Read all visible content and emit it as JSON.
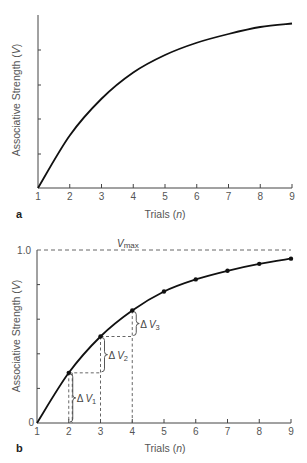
{
  "chart_data": [
    {
      "panel": "a",
      "type": "line",
      "title": "",
      "xlabel": "Trials (n)",
      "ylabel": "Associative Strength (V)",
      "x": [
        1,
        2,
        3,
        4,
        5,
        6,
        7,
        8,
        9
      ],
      "series": [
        {
          "name": "V",
          "values": [
            0.0,
            0.3,
            0.51,
            0.66,
            0.76,
            0.83,
            0.88,
            0.92,
            0.94
          ]
        }
      ],
      "xticks": [
        "1",
        "2",
        "3",
        "4",
        "5",
        "6",
        "7",
        "8",
        "9"
      ],
      "yticks_labeled": false,
      "ylim": [
        0,
        1.0
      ],
      "grid": false,
      "legend": "none"
    },
    {
      "panel": "b",
      "type": "line",
      "title": "",
      "xlabel": "Trials (n)",
      "ylabel": "Associative Strength (V)",
      "x": [
        1,
        2,
        3,
        4,
        5,
        6,
        7,
        8,
        9
      ],
      "series": [
        {
          "name": "V",
          "markers": true,
          "values": [
            0.0,
            0.29,
            0.5,
            0.65,
            0.76,
            0.83,
            0.88,
            0.92,
            0.95
          ]
        }
      ],
      "xticks": [
        "1",
        "2",
        "3",
        "4",
        "5",
        "6",
        "7",
        "8",
        "9"
      ],
      "yticks": [
        "0",
        "1.0"
      ],
      "ylim": [
        0,
        1.0
      ],
      "reference_line": {
        "label": "Vmax",
        "value": 1.0,
        "style": "dashed"
      },
      "annotations": [
        {
          "label": "ΔV1",
          "from_n": 1,
          "to_n": 2
        },
        {
          "label": "ΔV2",
          "from_n": 2,
          "to_n": 3
        },
        {
          "label": "ΔV3",
          "from_n": 3,
          "to_n": 4
        }
      ],
      "grid": false,
      "legend": "none"
    }
  ],
  "panels": {
    "a": {
      "label": "a",
      "xlabel_main": "Trials (",
      "xlabel_var": "n",
      "xlabel_end": ")",
      "ylabel_main": "Associative Strength (",
      "ylabel_var": "V",
      "ylabel_end": ")"
    },
    "b": {
      "label": "b",
      "xlabel_main": "Trials (",
      "xlabel_var": "n",
      "xlabel_end": ")",
      "ylabel_main": "Associative Strength (",
      "ylabel_var": "V",
      "ylabel_end": ")",
      "y_top_label": "1.0",
      "y_zero_label": "0",
      "vmax_main": "V",
      "vmax_sub": "max",
      "dv1_delta": "Δ",
      "dv1_var": "V",
      "dv1_sub": "1",
      "dv2_delta": "Δ",
      "dv2_var": "V",
      "dv2_sub": "2",
      "dv3_delta": "Δ",
      "dv3_var": "V",
      "dv3_sub": "3"
    }
  },
  "xtick_labels": [
    "1",
    "2",
    "3",
    "4",
    "5",
    "6",
    "7",
    "8",
    "9"
  ]
}
